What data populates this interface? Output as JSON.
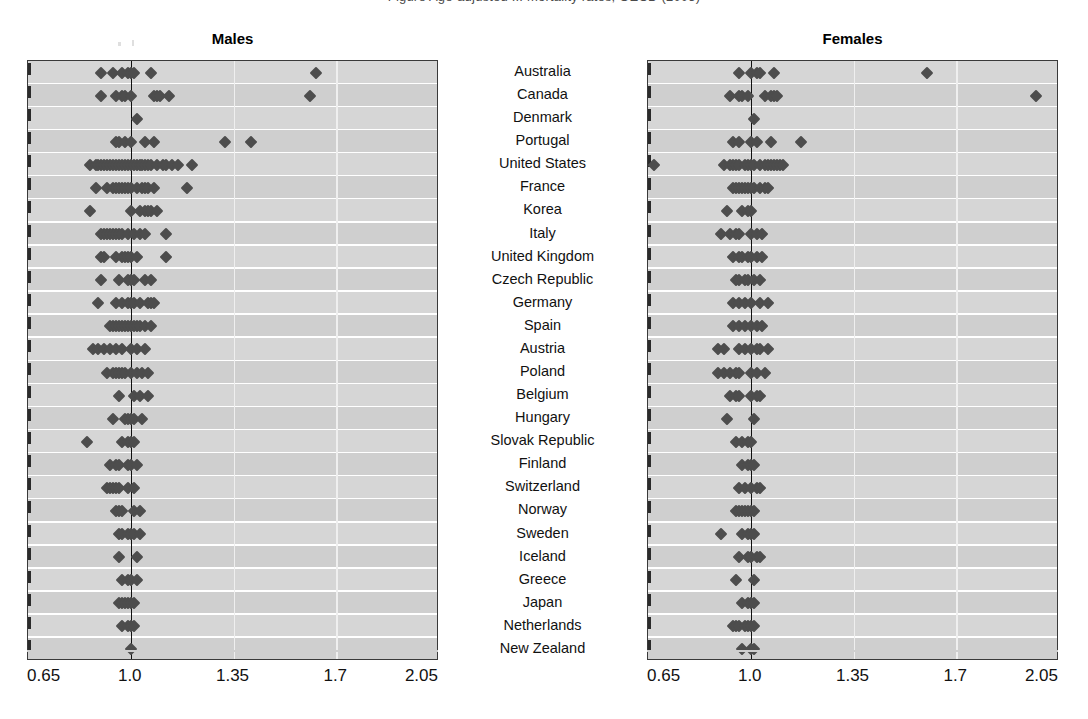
{
  "cropped_header_text": "Figure  Age-adjusted  ... mortality rates, OECD (2005)",
  "panels": {
    "males": {
      "title": "Males"
    },
    "females": {
      "title": "Females"
    }
  },
  "axis": {
    "ticks": [
      "0.65",
      "1.0",
      "1.35",
      "1.7",
      "2.05"
    ],
    "tick_values": [
      0.65,
      1.0,
      1.35,
      1.7,
      2.05
    ],
    "min": 0.65,
    "max": 2.05,
    "reference_value": 1.0
  },
  "countries": [
    "Australia",
    "Canada",
    "Denmark",
    "Portugal",
    "United States",
    "France",
    "Korea",
    "Italy",
    "United Kingdom",
    "Czech Republic",
    "Germany",
    "Spain",
    "Austria",
    "Poland",
    "Belgium",
    "Hungary",
    "Slovak Republic",
    "Finland",
    "Switzerland",
    "Norway",
    "Sweden",
    "Iceland",
    "Greece",
    "Japan",
    "Netherlands",
    "New Zealand"
  ],
  "colors": {
    "marker": "#4d4d4d",
    "panel_background": "#d6d6d6",
    "band_alt": "#cfcfcf",
    "reference_line": "#111111",
    "grid_line": "#efefef",
    "frame": "#3a3a3a",
    "text": "#111111"
  },
  "chart_data": {
    "type": "scatter",
    "xlabel": "",
    "ylabel": "",
    "xlim": [
      0.65,
      2.05
    ],
    "grid": true,
    "legend": "none",
    "annotations": [
      "vertical reference line at 1.0"
    ],
    "categories": [
      "Australia",
      "Canada",
      "Denmark",
      "Portugal",
      "United States",
      "France",
      "Korea",
      "Italy",
      "United Kingdom",
      "Czech Republic",
      "Germany",
      "Spain",
      "Austria",
      "Poland",
      "Belgium",
      "Hungary",
      "Slovak Republic",
      "Finland",
      "Switzerland",
      "Norway",
      "Sweden",
      "Iceland",
      "Greece",
      "Japan",
      "Netherlands",
      "New Zealand"
    ],
    "series": [
      {
        "name": "Males",
        "panel": "males",
        "rows": [
          [
            0.9,
            0.94,
            0.97,
            0.99,
            1.0,
            1.01,
            1.07,
            1.63
          ],
          [
            0.9,
            0.95,
            0.97,
            0.98,
            1.0,
            1.08,
            1.09,
            1.1,
            1.13,
            1.61
          ],
          [
            1.02
          ],
          [
            0.95,
            0.96,
            0.98,
            1.0,
            1.05,
            1.08,
            1.32,
            1.41
          ],
          [
            0.86,
            0.88,
            0.89,
            0.9,
            0.91,
            0.92,
            0.93,
            0.94,
            0.95,
            0.96,
            0.97,
            0.98,
            0.99,
            1.0,
            1.01,
            1.02,
            1.03,
            1.04,
            1.05,
            1.06,
            1.07,
            1.09,
            1.11,
            1.12,
            1.14,
            1.16,
            1.21
          ],
          [
            0.88,
            0.92,
            0.94,
            0.95,
            0.96,
            0.97,
            0.98,
            0.99,
            1.0,
            1.02,
            1.04,
            1.05,
            1.06,
            1.08,
            1.19
          ],
          [
            0.86,
            1.0,
            1.03,
            1.05,
            1.06,
            1.07,
            1.09
          ],
          [
            0.9,
            0.91,
            0.92,
            0.93,
            0.94,
            0.95,
            0.96,
            0.97,
            0.99,
            1.01,
            1.03,
            1.05,
            1.12
          ],
          [
            0.9,
            0.91,
            0.95,
            0.97,
            0.98,
            0.99,
            1.0,
            1.02,
            1.12
          ],
          [
            0.9,
            0.96,
            0.99,
            1.0,
            1.01,
            1.05,
            1.07
          ],
          [
            0.89,
            0.95,
            0.97,
            0.99,
            1.0,
            1.01,
            1.03,
            1.06,
            1.07,
            1.08
          ],
          [
            0.93,
            0.94,
            0.95,
            0.96,
            0.97,
            0.98,
            0.99,
            1.0,
            1.01,
            1.02,
            1.03,
            1.05,
            1.07
          ],
          [
            0.87,
            0.89,
            0.91,
            0.93,
            0.95,
            0.97,
            1.0,
            1.02,
            1.05
          ],
          [
            0.92,
            0.94,
            0.95,
            0.96,
            0.97,
            0.98,
            1.0,
            1.02,
            1.04,
            1.06
          ],
          [
            0.96,
            1.01,
            1.03,
            1.06
          ],
          [
            0.94,
            0.98,
            0.99,
            1.0,
            1.01,
            1.04
          ],
          [
            0.85,
            0.97,
            0.99,
            1.0,
            1.01
          ],
          [
            0.93,
            0.95,
            0.96,
            0.99,
            1.0,
            1.02
          ],
          [
            0.92,
            0.93,
            0.94,
            0.95,
            0.96,
            0.99,
            1.01
          ],
          [
            0.95,
            0.96,
            0.97,
            1.01,
            1.03
          ],
          [
            0.96,
            0.97,
            0.99,
            1.0,
            1.01,
            1.03
          ],
          [
            0.96,
            1.02
          ],
          [
            0.97,
            0.99,
            1.0,
            1.02
          ],
          [
            0.96,
            0.97,
            0.98,
            0.99,
            1.0,
            1.01
          ],
          [
            0.97,
            0.99,
            1.0,
            1.01
          ],
          [
            1.0
          ]
        ]
      },
      {
        "name": "Females",
        "panel": "females",
        "rows": [
          [
            0.96,
            1.0,
            1.02,
            1.03,
            1.08,
            1.6
          ],
          [
            0.93,
            0.96,
            0.97,
            0.99,
            1.05,
            1.07,
            1.08,
            1.09,
            1.97
          ],
          [
            1.01
          ],
          [
            0.94,
            0.96,
            1.0,
            1.02,
            1.07,
            1.17
          ],
          [
            0.67,
            0.91,
            0.93,
            0.94,
            0.95,
            0.96,
            0.98,
            0.99,
            1.0,
            1.01,
            1.03,
            1.05,
            1.06,
            1.07,
            1.08,
            1.09,
            1.1,
            1.11
          ],
          [
            0.94,
            0.95,
            0.96,
            0.97,
            0.98,
            0.99,
            1.0,
            1.01,
            1.03,
            1.05,
            1.06
          ],
          [
            0.92,
            0.97,
            0.99,
            1.0
          ],
          [
            0.9,
            0.93,
            0.95,
            0.96,
            1.0,
            1.02,
            1.04
          ],
          [
            0.94,
            0.96,
            0.97,
            0.99,
            1.0,
            1.02,
            1.04
          ],
          [
            0.95,
            0.96,
            0.98,
            0.99,
            1.01,
            1.03
          ],
          [
            0.94,
            0.96,
            0.98,
            1.0,
            1.03,
            1.06
          ],
          [
            0.94,
            0.96,
            0.98,
            1.0,
            1.02,
            1.04
          ],
          [
            0.89,
            0.91,
            0.96,
            0.98,
            1.0,
            1.02,
            1.03,
            1.06
          ],
          [
            0.89,
            0.91,
            0.93,
            0.95,
            0.96,
            1.0,
            1.02,
            1.05
          ],
          [
            0.93,
            0.95,
            0.96,
            1.0,
            1.02,
            1.03
          ],
          [
            0.92,
            1.01
          ],
          [
            0.95,
            0.97,
            0.99,
            1.0
          ],
          [
            0.97,
            0.99,
            1.0,
            1.01
          ],
          [
            0.96,
            0.98,
            1.0,
            1.02,
            1.03
          ],
          [
            0.95,
            0.96,
            0.97,
            0.98,
            0.99,
            1.0,
            1.01
          ],
          [
            0.9,
            0.97,
            0.99,
            1.0,
            1.01
          ],
          [
            0.96,
            0.99,
            1.0,
            1.02,
            1.03
          ],
          [
            0.95,
            1.01
          ],
          [
            0.97,
            0.99,
            1.0,
            1.01
          ],
          [
            0.94,
            0.95,
            0.96,
            0.98,
            0.99,
            1.0,
            1.01
          ],
          [
            0.97,
            1.0,
            1.01
          ]
        ]
      }
    ]
  }
}
